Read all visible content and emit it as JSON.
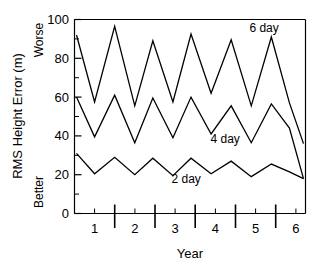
{
  "chart_data": {
    "type": "line",
    "title": "",
    "xlabel": "Year",
    "ylabel": "RMS Height Error (m)",
    "xlim": [
      0.5,
      6.25
    ],
    "ylim": [
      0,
      100
    ],
    "grid": false,
    "legend_position": "inline-annotations",
    "y_tick_labels": [
      "0",
      "20",
      "40",
      "60",
      "80",
      "100"
    ],
    "y_ticks": [
      0,
      20,
      40,
      60,
      80,
      100
    ],
    "y_minor_ticks": [
      10,
      30,
      50,
      70,
      90
    ],
    "x_tick_labels": [
      "1",
      "2",
      "3",
      "4",
      "5",
      "6"
    ],
    "x_ticks": [
      1,
      2,
      3,
      4,
      5,
      6
    ],
    "x_long_ticks": [
      1.5,
      2.5,
      3.5,
      4.5,
      5.5
    ],
    "y_axis_top_note": "Worse",
    "y_axis_bottom_note": "Better",
    "x": [
      0.55,
      1.0,
      1.5,
      2.0,
      2.45,
      2.95,
      3.4,
      3.9,
      4.4,
      4.9,
      5.4,
      5.85,
      6.2
    ],
    "series": [
      {
        "name": "6 day",
        "label": "6 day",
        "label_x": 5.22,
        "label_y": 93.5,
        "values": [
          92,
          57.5,
          96.5,
          55.5,
          89,
          57.5,
          92.5,
          62,
          89.5,
          55.5,
          91,
          57,
          36
        ]
      },
      {
        "name": "4 day",
        "label": "4 day",
        "label_x": 4.25,
        "label_y": 36.5,
        "values": [
          60,
          39.5,
          61,
          36.5,
          59.5,
          39,
          60,
          41,
          55.5,
          36.5,
          56.5,
          44,
          18
        ]
      },
      {
        "name": "2 day",
        "label": "2 day",
        "label_x": 3.28,
        "label_y": 15.5,
        "values": [
          31,
          20.5,
          29,
          20,
          28.5,
          19.5,
          28.5,
          20.5,
          27,
          19,
          25.5,
          21.5,
          18
        ]
      }
    ]
  },
  "axes": {
    "y_title": "RMS Height Error (m)",
    "x_title": "Year",
    "worse_label": "Worse",
    "better_label": "Better"
  },
  "colors": {
    "line": "#000000",
    "axis": "#000000",
    "background": "#ffffff"
  }
}
